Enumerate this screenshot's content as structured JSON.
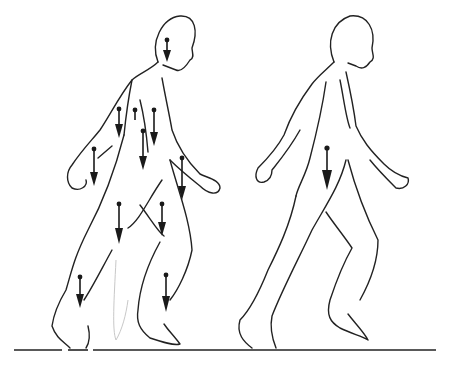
{
  "diagram": {
    "figures": [
      {
        "id": "segmented-figure",
        "arrow_count": 11
      },
      {
        "id": "whole-body-figure",
        "arrow_count": 1
      }
    ],
    "colors": {
      "line": "#222222",
      "arrow": "#1a1a1a",
      "background": "#ffffff"
    }
  }
}
